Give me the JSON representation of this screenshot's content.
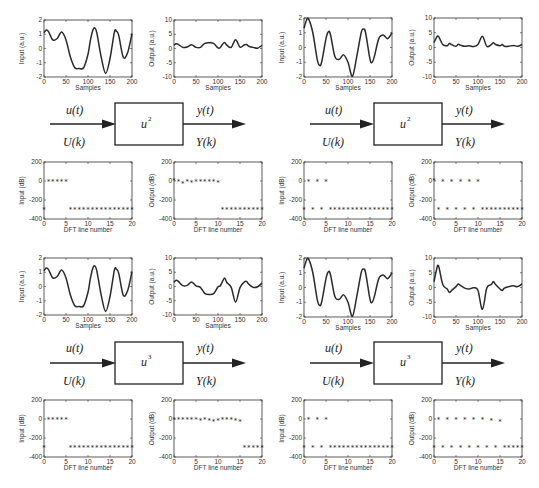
{
  "diagrams": [
    {
      "input_time": "u(t)",
      "input_freq": "U(k)",
      "block_base": "u",
      "block_exp": "2",
      "output_time": "y(t)",
      "output_freq": "Y(k)"
    },
    {
      "input_time": "u(t)",
      "input_freq": "U(k)",
      "block_base": "u",
      "block_exp": "2",
      "output_time": "y(t)",
      "output_freq": "Y(k)"
    },
    {
      "input_time": "u(t)",
      "input_freq": "U(k)",
      "block_base": "u",
      "block_exp": "3",
      "output_time": "y(t)",
      "output_freq": "Y(k)"
    },
    {
      "input_time": "u(t)",
      "input_freq": "U(k)",
      "block_base": "u",
      "block_exp": "3",
      "output_time": "y(t)",
      "output_freq": "Y(k)"
    }
  ],
  "chart_data": [
    {
      "id": "r1-left-input",
      "type": "line",
      "xlabel": "Samples",
      "ylabel": "Input (a.u.)",
      "xlim": [
        0,
        200
      ],
      "ylim": [
        -2,
        2
      ],
      "xticks": [
        0,
        50,
        100,
        150,
        200
      ],
      "yticks": [
        -2,
        -1,
        0,
        1,
        2
      ],
      "x": [
        0,
        5,
        10,
        20,
        30,
        40,
        50,
        60,
        70,
        80,
        90,
        100,
        105,
        110,
        115,
        120,
        130,
        140,
        150,
        160,
        165,
        170,
        180,
        190,
        200
      ],
      "y": [
        1.1,
        1.3,
        1.2,
        0.6,
        0.7,
        1.15,
        0.6,
        -0.6,
        -1.35,
        -1.4,
        -1.35,
        -0.4,
        0.5,
        1.2,
        1.45,
        1.1,
        -0.6,
        -1.75,
        -0.7,
        1.15,
        1.2,
        0.9,
        -0.6,
        -0.3,
        1.05
      ]
    },
    {
      "id": "r1-left-output",
      "type": "line",
      "xlabel": "Samples",
      "ylabel": "Output (a.u.)",
      "xlim": [
        0,
        200
      ],
      "ylim": [
        -10,
        10
      ],
      "xticks": [
        0,
        50,
        100,
        150,
        200
      ],
      "yticks": [
        -10,
        -5,
        0,
        5,
        10
      ],
      "x": [
        0,
        5,
        10,
        20,
        30,
        40,
        50,
        60,
        70,
        80,
        90,
        100,
        105,
        110,
        115,
        120,
        130,
        140,
        150,
        160,
        165,
        170,
        180,
        190,
        200
      ],
      "y": [
        1.2,
        1.7,
        1.4,
        0.4,
        0.5,
        1.3,
        0.4,
        0.4,
        1.8,
        2,
        1.8,
        0.2,
        0.3,
        1.4,
        2.1,
        1.2,
        0.4,
        3.1,
        0.5,
        1.3,
        1.4,
        0.8,
        0.4,
        0.1,
        1.1
      ]
    },
    {
      "id": "r1-right-input",
      "type": "line",
      "xlabel": "Samples",
      "ylabel": "Input (a.u.)",
      "xlim": [
        0,
        200
      ],
      "ylim": [
        -2,
        2
      ],
      "xticks": [
        0,
        50,
        100,
        150,
        200
      ],
      "yticks": [
        -2,
        -1,
        0,
        1,
        2
      ],
      "x": [
        0,
        5,
        10,
        20,
        30,
        35,
        40,
        50,
        55,
        60,
        70,
        80,
        90,
        100,
        110,
        120,
        130,
        135,
        140,
        150,
        155,
        160,
        170,
        180,
        190,
        200
      ],
      "y": [
        1.3,
        1.8,
        1.95,
        1.0,
        -0.8,
        -1.2,
        -1.0,
        0.6,
        1.05,
        0.9,
        -0.6,
        -0.8,
        -0.5,
        -1.0,
        -1.95,
        -0.6,
        1.0,
        1.25,
        1.0,
        -0.8,
        -1.0,
        -0.6,
        0.6,
        0.85,
        0.6,
        1.0
      ]
    },
    {
      "id": "r1-right-output",
      "type": "line",
      "xlabel": "Samples",
      "ylabel": "Output (a.u.)",
      "xlim": [
        0,
        200
      ],
      "ylim": [
        -10,
        10
      ],
      "xticks": [
        0,
        50,
        100,
        150,
        200
      ],
      "yticks": [
        -10,
        -5,
        0,
        5,
        10
      ],
      "x": [
        0,
        5,
        10,
        20,
        30,
        35,
        40,
        50,
        55,
        60,
        70,
        80,
        90,
        100,
        110,
        120,
        130,
        135,
        140,
        150,
        155,
        160,
        170,
        180,
        190,
        200
      ],
      "y": [
        1.7,
        3.2,
        3.8,
        1.0,
        0.6,
        1.4,
        1.0,
        0.4,
        1.1,
        0.8,
        0.4,
        0.6,
        0.3,
        1.0,
        3.8,
        0.4,
        1.0,
        1.6,
        1.0,
        0.6,
        1.0,
        0.4,
        0.4,
        0.7,
        0.4,
        1.0
      ]
    },
    {
      "id": "r2-left-input",
      "type": "scatter",
      "marker": "*",
      "xlabel": "DFT line number",
      "ylabel": "Input (dB)",
      "xlim": [
        0,
        20
      ],
      "ylim": [
        -400,
        200
      ],
      "xticks": [
        0,
        5,
        10,
        15,
        20
      ],
      "yticks": [
        -400,
        -200,
        0,
        200
      ],
      "x": [
        0,
        1,
        2,
        3,
        4,
        5,
        6,
        7,
        8,
        9,
        10,
        11,
        12,
        13,
        14,
        15,
        16,
        17,
        18,
        19,
        20
      ],
      "y": [
        -300,
        0,
        0,
        0,
        0,
        0,
        -300,
        -300,
        -300,
        -300,
        -300,
        -300,
        -300,
        -300,
        -300,
        -300,
        -300,
        -300,
        -300,
        -300,
        -300
      ]
    },
    {
      "id": "r2-left-output",
      "type": "scatter",
      "marker": "*",
      "xlabel": "DFT line number",
      "ylabel": "Output (dB)",
      "xlim": [
        0,
        20
      ],
      "ylim": [
        -400,
        200
      ],
      "xticks": [
        0,
        5,
        10,
        15,
        20
      ],
      "yticks": [
        -400,
        -200,
        0,
        200
      ],
      "x": [
        0,
        1,
        2,
        3,
        4,
        5,
        6,
        7,
        8,
        9,
        10,
        11,
        12,
        13,
        14,
        15,
        16,
        17,
        18,
        19,
        20
      ],
      "y": [
        5,
        -10,
        -25,
        -5,
        -15,
        -10,
        -10,
        -10,
        -10,
        -10,
        -15,
        -300,
        -300,
        -300,
        -300,
        -300,
        -300,
        -300,
        -300,
        -300,
        -300
      ]
    },
    {
      "id": "r2-right-input",
      "type": "scatter",
      "marker": "*",
      "xlabel": "DFT line number",
      "ylabel": "Input (dB)",
      "xlim": [
        0,
        20
      ],
      "ylim": [
        -400,
        200
      ],
      "xticks": [
        0,
        5,
        10,
        15,
        20
      ],
      "yticks": [
        -400,
        -200,
        0,
        200
      ],
      "x": [
        0,
        1,
        2,
        3,
        4,
        5,
        6,
        7,
        8,
        9,
        10,
        11,
        12,
        13,
        14,
        15,
        16,
        17,
        18,
        19,
        20
      ],
      "y": [
        -300,
        0,
        -300,
        0,
        -300,
        0,
        -300,
        -300,
        -300,
        -300,
        -300,
        -300,
        -300,
        -300,
        -300,
        -300,
        -300,
        -300,
        -300,
        -300,
        -300
      ]
    },
    {
      "id": "r2-right-output",
      "type": "scatter",
      "marker": "*",
      "xlabel": "DFT line number",
      "ylabel": "Output (dB)",
      "xlim": [
        0,
        20
      ],
      "ylim": [
        -400,
        200
      ],
      "xticks": [
        0,
        5,
        10,
        15,
        20
      ],
      "yticks": [
        -400,
        -200,
        0,
        200
      ],
      "x": [
        0,
        1,
        2,
        3,
        4,
        5,
        6,
        7,
        8,
        9,
        10,
        11,
        12,
        13,
        14,
        15,
        16,
        17,
        18,
        19,
        20
      ],
      "y": [
        5,
        -300,
        0,
        -300,
        0,
        -300,
        0,
        -300,
        0,
        -300,
        -10,
        -300,
        -300,
        -300,
        -300,
        -300,
        -300,
        -300,
        -300,
        -300,
        -300
      ]
    },
    {
      "id": "r3-left-input",
      "type": "line",
      "xlabel": "Samples",
      "ylabel": "Input (a.u.)",
      "xlim": [
        0,
        200
      ],
      "ylim": [
        -2,
        2
      ],
      "xticks": [
        0,
        50,
        100,
        150,
        200
      ],
      "yticks": [
        -2,
        -1,
        0,
        1,
        2
      ],
      "x": [
        0,
        5,
        10,
        20,
        30,
        40,
        50,
        60,
        70,
        80,
        90,
        100,
        105,
        110,
        115,
        120,
        130,
        140,
        150,
        160,
        165,
        170,
        180,
        190,
        200
      ],
      "y": [
        1.1,
        1.3,
        1.2,
        0.6,
        0.7,
        1.15,
        0.6,
        -0.6,
        -1.35,
        -1.4,
        -1.35,
        -0.4,
        0.5,
        1.2,
        1.45,
        1.1,
        -0.6,
        -1.75,
        -0.7,
        1.15,
        1.2,
        0.9,
        -0.6,
        -0.3,
        1.05
      ]
    },
    {
      "id": "r3-left-output",
      "type": "line",
      "xlabel": "Samples",
      "ylabel": "Output (a.u.)",
      "xlim": [
        0,
        200
      ],
      "ylim": [
        -10,
        10
      ],
      "xticks": [
        0,
        50,
        100,
        150,
        200
      ],
      "yticks": [
        -10,
        -5,
        0,
        5,
        10
      ],
      "x": [
        0,
        5,
        10,
        20,
        30,
        40,
        50,
        60,
        70,
        80,
        90,
        100,
        105,
        110,
        115,
        120,
        130,
        140,
        150,
        160,
        165,
        170,
        180,
        190,
        200
      ],
      "y": [
        1.5,
        2.2,
        1.8,
        0.3,
        0.4,
        1.6,
        0.2,
        -0.3,
        -2.4,
        -2.8,
        -2.5,
        -0.1,
        0.2,
        1.7,
        3.0,
        1.4,
        -0.3,
        -5.5,
        -0.4,
        1.6,
        1.8,
        0.8,
        -0.3,
        -0.1,
        1.2
      ]
    },
    {
      "id": "r3-right-input",
      "type": "line",
      "xlabel": "Samples",
      "ylabel": "Input (a.u.)",
      "xlim": [
        0,
        200
      ],
      "ylim": [
        -2,
        2
      ],
      "xticks": [
        0,
        50,
        100,
        150,
        200
      ],
      "yticks": [
        -2,
        -1,
        0,
        1,
        2
      ],
      "x": [
        0,
        5,
        10,
        20,
        30,
        35,
        40,
        50,
        55,
        60,
        70,
        80,
        90,
        100,
        110,
        120,
        130,
        135,
        140,
        150,
        155,
        160,
        170,
        180,
        190,
        200
      ],
      "y": [
        1.3,
        1.8,
        1.95,
        1.0,
        -0.8,
        -1.2,
        -1.0,
        0.6,
        1.05,
        0.9,
        -0.6,
        -0.8,
        -0.5,
        -1.0,
        -1.95,
        -0.6,
        1.0,
        1.25,
        1.0,
        -0.8,
        -1.0,
        -0.6,
        0.6,
        0.85,
        0.6,
        1.0
      ]
    },
    {
      "id": "r3-right-output",
      "type": "line",
      "xlabel": "Samples",
      "ylabel": "Output (a.u.)",
      "xlim": [
        0,
        200
      ],
      "ylim": [
        -10,
        10
      ],
      "xticks": [
        0,
        50,
        100,
        150,
        200
      ],
      "yticks": [
        -10,
        -5,
        0,
        5,
        10
      ],
      "x": [
        0,
        5,
        10,
        20,
        30,
        35,
        40,
        50,
        55,
        60,
        70,
        80,
        90,
        100,
        110,
        120,
        130,
        135,
        140,
        150,
        155,
        160,
        170,
        180,
        190,
        200
      ],
      "y": [
        2.0,
        5.5,
        7.4,
        1.0,
        -0.5,
        -1.7,
        -1.0,
        0.3,
        1.2,
        0.7,
        -0.2,
        -0.5,
        -0.1,
        -1.0,
        -7.4,
        -0.2,
        1.0,
        2.0,
        1.0,
        -0.5,
        -1.0,
        -0.2,
        0.3,
        0.6,
        0.3,
        1.2
      ]
    },
    {
      "id": "r4-left-input",
      "type": "scatter",
      "marker": "*",
      "xlabel": "DFT line number",
      "ylabel": "Input (dB)",
      "xlim": [
        0,
        20
      ],
      "ylim": [
        -400,
        200
      ],
      "xticks": [
        0,
        5,
        10,
        15,
        20
      ],
      "yticks": [
        -400,
        -200,
        0,
        200
      ],
      "x": [
        0,
        1,
        2,
        3,
        4,
        5,
        6,
        7,
        8,
        9,
        10,
        11,
        12,
        13,
        14,
        15,
        16,
        17,
        18,
        19,
        20
      ],
      "y": [
        -300,
        0,
        0,
        0,
        0,
        0,
        -300,
        -300,
        -300,
        -300,
        -300,
        -300,
        -300,
        -300,
        -300,
        -300,
        -300,
        -300,
        -300,
        -300,
        -300
      ]
    },
    {
      "id": "r4-left-output",
      "type": "scatter",
      "marker": "*",
      "xlabel": "DFT line number",
      "ylabel": "Output (dB)",
      "xlim": [
        0,
        20
      ],
      "ylim": [
        -400,
        200
      ],
      "xticks": [
        0,
        5,
        10,
        15,
        20
      ],
      "yticks": [
        -400,
        -200,
        0,
        200
      ],
      "x": [
        0,
        1,
        2,
        3,
        4,
        5,
        6,
        7,
        8,
        9,
        10,
        11,
        12,
        13,
        14,
        15,
        16,
        17,
        18,
        19,
        20
      ],
      "y": [
        0,
        0,
        0,
        0,
        0,
        -5,
        -15,
        -10,
        -20,
        -30,
        -20,
        -10,
        -10,
        -10,
        -15,
        -25,
        -300,
        -300,
        -300,
        -300,
        -300
      ]
    },
    {
      "id": "r4-right-input",
      "type": "scatter",
      "marker": "*",
      "xlabel": "DFT line number",
      "ylabel": "Input (dB)",
      "xlim": [
        0,
        20
      ],
      "ylim": [
        -400,
        200
      ],
      "xticks": [
        0,
        5,
        10,
        15,
        20
      ],
      "yticks": [
        -400,
        -200,
        0,
        200
      ],
      "x": [
        0,
        1,
        2,
        3,
        4,
        5,
        6,
        7,
        8,
        9,
        10,
        11,
        12,
        13,
        14,
        15,
        16,
        17,
        18,
        19,
        20
      ],
      "y": [
        -300,
        0,
        -300,
        0,
        -300,
        0,
        -300,
        -300,
        -300,
        -300,
        -300,
        -300,
        -300,
        -300,
        -300,
        -300,
        -300,
        -300,
        -300,
        -300,
        -300
      ]
    },
    {
      "id": "r4-right-output",
      "type": "scatter",
      "marker": "*",
      "xlabel": "DFT line number",
      "ylabel": "Output (dB)",
      "xlim": [
        0,
        20
      ],
      "ylim": [
        -400,
        200
      ],
      "xticks": [
        0,
        5,
        10,
        15,
        20
      ],
      "yticks": [
        -400,
        -200,
        0,
        200
      ],
      "x": [
        0,
        1,
        2,
        3,
        4,
        5,
        6,
        7,
        8,
        9,
        10,
        11,
        12,
        13,
        14,
        15,
        16,
        17,
        18,
        19,
        20
      ],
      "y": [
        -300,
        0,
        -300,
        0,
        -300,
        0,
        -300,
        -5,
        -300,
        -10,
        -300,
        -10,
        -300,
        -15,
        -300,
        -25,
        -300,
        -300,
        -300,
        -300,
        -300
      ]
    }
  ]
}
